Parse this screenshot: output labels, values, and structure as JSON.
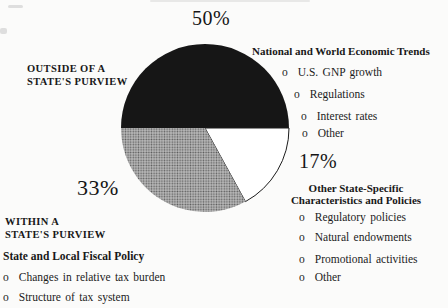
{
  "page": {
    "background": "#fbfbfa",
    "text_color": "#1b1b1b"
  },
  "chart_data": {
    "type": "pie",
    "unit": "%",
    "start_angle_deg": 180,
    "direction": "clockwise",
    "bullet_glyph": "o",
    "legend_position": "around-pie",
    "slices": [
      {
        "value": 50,
        "label": "50%",
        "color": "#161616",
        "texture": "solid",
        "region": "OUTSIDE OF A\nSTATE'S PURVIEW",
        "heading": "National and World Economic Trends",
        "items": [
          "U.S. GNP growth",
          "Regulations",
          "Interest rates",
          "Other"
        ]
      },
      {
        "value": 17,
        "label": "17%",
        "color": "#ffffff",
        "outline": "#1c1c1c",
        "texture": "solid",
        "region": "",
        "heading": "Other State-Specific\nCharacteristics and Policies",
        "items": [
          "Regulatory policies",
          "Natural endowments",
          "Promotional activities",
          "Other"
        ]
      },
      {
        "value": 33,
        "label": "33%",
        "color": "#9c9c9c",
        "texture": "halftone-dots",
        "region": "WITHIN A\nSTATE'S PURVIEW",
        "heading": "State and Local Fiscal Policy",
        "items": [
          "Changes in relative tax burden",
          "Structure of tax system"
        ]
      }
    ]
  }
}
